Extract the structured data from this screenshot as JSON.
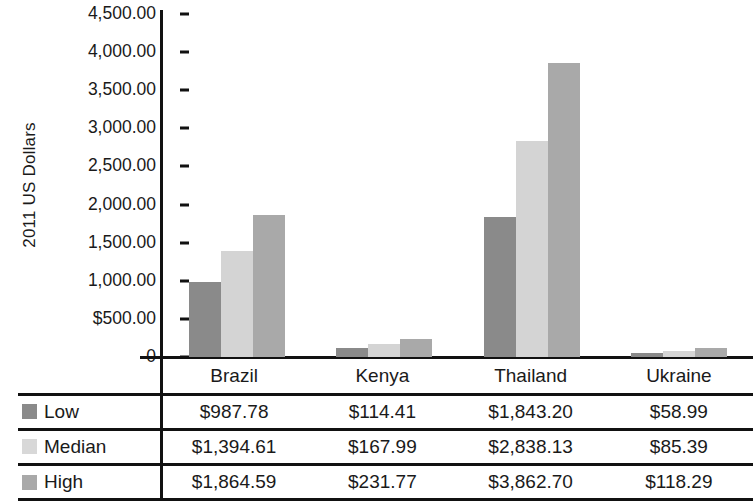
{
  "chart_data": {
    "type": "bar",
    "title": "",
    "xlabel": "",
    "ylabel": "2011 US Dollars",
    "ylim": [
      0,
      4500
    ],
    "grid": false,
    "legend_position": "table-left-column",
    "categories": [
      "Brazil",
      "Kenya",
      "Thailand",
      "Ukraine"
    ],
    "ytick_labels": [
      "4,500.00",
      "4,000.00",
      "3,500.00",
      "3,000.00",
      "2,500.00",
      "2,000.00",
      "1,500.00",
      "1,000.00",
      "$500.00",
      "0"
    ],
    "ytick_values": [
      4500,
      4000,
      3500,
      3000,
      2500,
      2000,
      1500,
      1000,
      500,
      0
    ],
    "series": [
      {
        "name": "Low",
        "color": "#8a8a8a",
        "values": [
          987.78,
          114.41,
          1843.2,
          58.99
        ],
        "labels": [
          "$987.78",
          "$114.41",
          "$1,843.20",
          "$58.99"
        ]
      },
      {
        "name": "Median",
        "color": "#d4d4d4",
        "values": [
          1394.61,
          167.99,
          2838.13,
          85.39
        ],
        "labels": [
          "$1,394.61",
          "$167.99",
          "$2,838.13",
          "$85.39"
        ]
      },
      {
        "name": "High",
        "color": "#a9a9a9",
        "values": [
          1864.59,
          231.77,
          3862.7,
          118.29
        ],
        "labels": [
          "$1,864.59",
          "$231.77",
          "$3,862.70",
          "$118.29"
        ]
      }
    ]
  },
  "axis": {
    "ylabel": "2011 US Dollars"
  },
  "table": {
    "header": [
      "",
      "Brazil",
      "Kenya",
      "Thailand",
      "Ukraine"
    ],
    "rows": [
      {
        "label": "Low",
        "swatch": "low-color-swatch",
        "values": [
          "$987.78",
          "$114.41",
          "$1,843.20",
          "$58.99"
        ]
      },
      {
        "label": "Median",
        "swatch": "median-color-swatch",
        "values": [
          "$1,394.61",
          "$167.99",
          "$2,838.13",
          "$85.39"
        ]
      },
      {
        "label": "High",
        "swatch": "high-color-swatch",
        "values": [
          "$1,864.59",
          "$231.77",
          "$3,862.70",
          "$118.29"
        ]
      }
    ]
  }
}
